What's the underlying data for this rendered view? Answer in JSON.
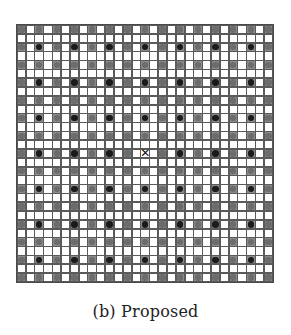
{
  "figure": {
    "caption": "(b) Proposed",
    "grid": {
      "rows": 29,
      "cols": 29,
      "pattern_description": "Circles occupy even-row/even-column cells. Rows with index divisible by 4 contain only gray circles; rows with index ≡ 2 (mod 4) alternate gray and black circles, black at columns ≡ 2 (mod 4). Odd rows and odd columns are empty white cells.",
      "cell_types": {
        "empty": "white square",
        "gray": "gray circle",
        "black": "black circle",
        "mark": "center marker (×)"
      },
      "center_marker": {
        "row": 14,
        "col": 14,
        "symbol": "✕"
      },
      "colors": {
        "grid_line": "#5a5a5a",
        "empty_cell": "#ffffff",
        "gray_circle": "#6c6c6c",
        "black_circle": "#1a1a1a",
        "marker": "#111111"
      }
    }
  }
}
